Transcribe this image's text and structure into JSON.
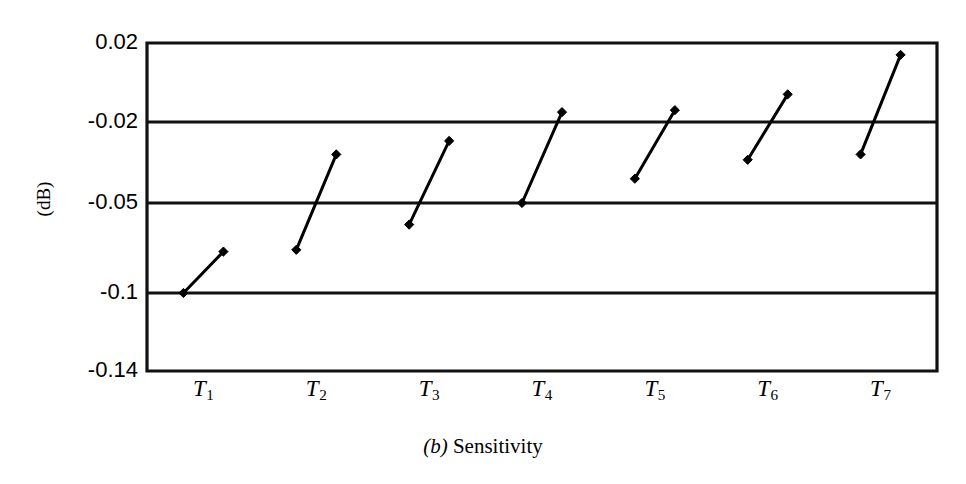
{
  "figure": {
    "caption_letter": "(b)",
    "caption_text": "Sensitivity",
    "background_color": "#ffffff",
    "ink_color": "#000000"
  },
  "chart_data": {
    "type": "line",
    "xlabel": "",
    "ylabel": "(dB)",
    "grid": true,
    "legend": "none",
    "categories": [
      "T1",
      "T2",
      "T3",
      "T4",
      "T5",
      "T6",
      "T7"
    ],
    "category_labels": [
      {
        "base": "T",
        "sub": "1"
      },
      {
        "base": "T",
        "sub": "2"
      },
      {
        "base": "T",
        "sub": "3"
      },
      {
        "base": "T",
        "sub": "4"
      },
      {
        "base": "T",
        "sub": "5"
      },
      {
        "base": "T",
        "sub": "6"
      },
      {
        "base": "T",
        "sub": "7"
      }
    ],
    "y_tick_labels": [
      "0.02",
      "-0.02",
      "-0.05",
      "-0.1",
      "-0.14"
    ],
    "y_tick_values": [
      0.02,
      -0.02,
      -0.05,
      -0.1,
      -0.14
    ],
    "ylim": [
      -0.14,
      0.02
    ],
    "y_axis_note": "non-uniform tick spacing",
    "series": [
      {
        "name": "sensitivity-range",
        "description": "vertical span segment per test condition, low end to high end",
        "points": [
          {
            "category": "T1",
            "low": -0.1,
            "high": -0.077
          },
          {
            "category": "T2",
            "low": -0.076,
            "high": -0.032
          },
          {
            "category": "T3",
            "low": -0.062,
            "high": -0.027
          },
          {
            "category": "T4",
            "low": -0.05,
            "high": -0.015
          },
          {
            "category": "T5",
            "low": -0.041,
            "high": -0.014
          },
          {
            "category": "T6",
            "low": -0.034,
            "high": -0.006
          },
          {
            "category": "T7",
            "low": -0.032,
            "high": 0.014
          }
        ]
      }
    ]
  }
}
